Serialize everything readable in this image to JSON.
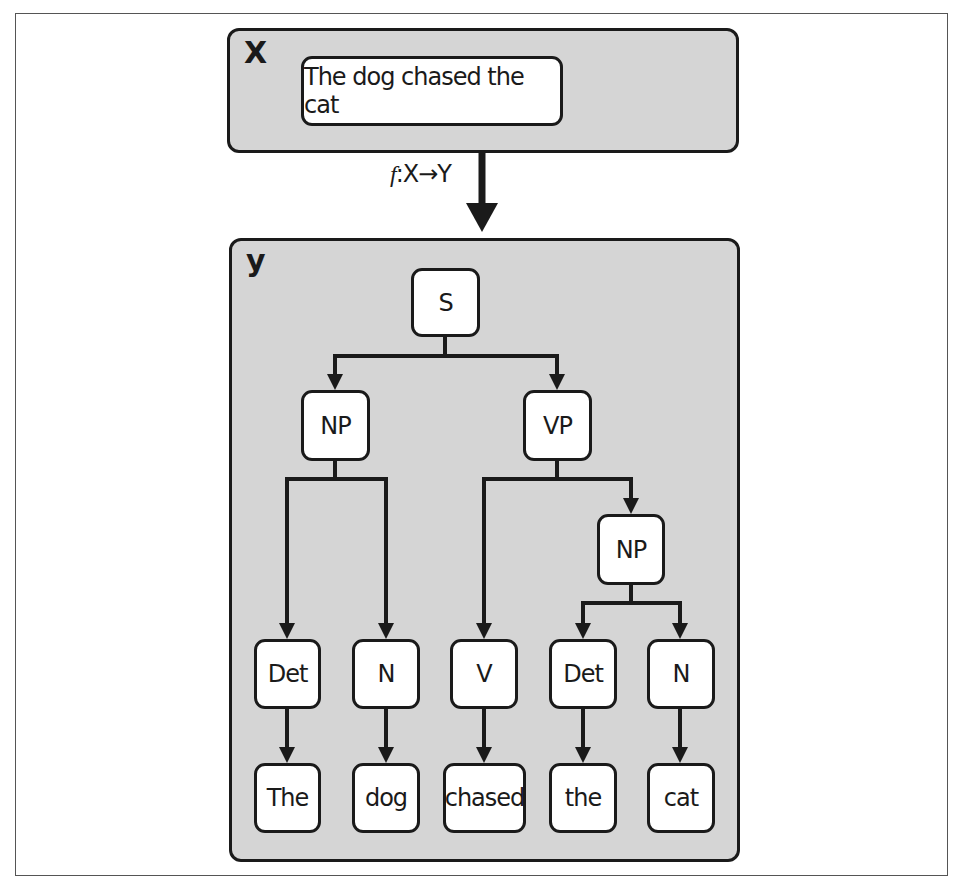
{
  "input_panel": {
    "label": "X",
    "sentence": "The dog chased the cat"
  },
  "mapping": {
    "function_name": "f",
    "signature": ":X→Y"
  },
  "output_panel": {
    "label": "y",
    "tree": {
      "root": "S",
      "np1": "NP",
      "vp": "VP",
      "np2": "NP",
      "pos": [
        "Det",
        "N",
        "V",
        "Det",
        "N"
      ],
      "words": [
        "The",
        "dog",
        "chased",
        "the",
        "cat"
      ]
    }
  },
  "colors": {
    "panel_fill": "#d5d5d5",
    "node_fill": "#ffffff",
    "stroke": "#1a1a1a"
  }
}
